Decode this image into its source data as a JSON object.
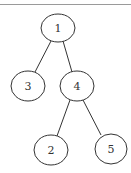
{
  "diagram": {
    "type": "binary-tree",
    "nodes": [
      {
        "id": "1",
        "label": "1",
        "cx": 58,
        "cy": 28
      },
      {
        "id": "3",
        "label": "3",
        "cx": 28,
        "cy": 86
      },
      {
        "id": "4",
        "label": "4",
        "cx": 77,
        "cy": 86
      },
      {
        "id": "2",
        "label": "2",
        "cx": 51,
        "cy": 150
      },
      {
        "id": "5",
        "label": "5",
        "cx": 111,
        "cy": 149
      }
    ],
    "edges": [
      {
        "from": "1",
        "to": "3"
      },
      {
        "from": "1",
        "to": "4"
      },
      {
        "from": "4",
        "to": "2"
      },
      {
        "from": "4",
        "to": "5"
      }
    ]
  }
}
